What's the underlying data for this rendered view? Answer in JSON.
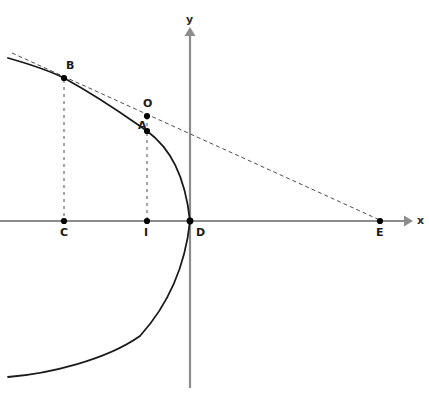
{
  "figure": {
    "caption": "",
    "background_color": "#ffffff",
    "axis_color": "#8c8c8c",
    "curve_color": "#1a1a1a",
    "dash_color": "#4d4d4d",
    "point_color": "#000000",
    "label_color": "#1a1a1a"
  },
  "axes": {
    "x": {
      "label": "x",
      "label_x": 417,
      "label_y": 215,
      "y_pixel": 221,
      "start_x": 0,
      "end_x": 412,
      "arrow": true
    },
    "y": {
      "label": "y",
      "label_x": 186,
      "label_y": 14,
      "x_pixel": 190,
      "start_y": 28,
      "end_y": 388,
      "arrow": true
    }
  },
  "points": [
    {
      "id": "B",
      "label": "B",
      "x": 64,
      "y": 78,
      "label_x": 66,
      "label_y": 60,
      "on_curve": true,
      "role": "tangency-point"
    },
    {
      "id": "O",
      "label": "O",
      "x": 147,
      "y": 116,
      "label_x": 143,
      "label_y": 98,
      "on_curve": false,
      "role": "tangent-line-point"
    },
    {
      "id": "A",
      "label": "A",
      "x": 147,
      "y": 131,
      "label_x": 138,
      "label_y": 120,
      "on_curve": true,
      "role": "curve-point"
    },
    {
      "id": "C",
      "label": "C",
      "x": 64,
      "y": 221,
      "label_x": 60,
      "label_y": 227,
      "on_curve": false,
      "role": "x-axis-foot"
    },
    {
      "id": "I",
      "label": "I",
      "x": 147,
      "y": 221,
      "label_x": 144,
      "label_y": 227,
      "on_curve": false,
      "role": "x-axis-foot"
    },
    {
      "id": "D",
      "label": "D",
      "x": 190,
      "y": 221,
      "label_x": 196,
      "label_y": 227,
      "on_curve": true,
      "role": "vertex-origin"
    },
    {
      "id": "E",
      "label": "E",
      "x": 380,
      "y": 221,
      "label_x": 376,
      "label_y": 227,
      "on_curve": false,
      "role": "tangent-x-intercept"
    }
  ],
  "curve": {
    "type": "parabola",
    "opens": "left",
    "vertex": {
      "x": 190,
      "y": 221
    },
    "description": "leftward-opening parabola through A(147,131), B(64,78), vertex D(190,221)",
    "path": "M 8,58 C 36,66 56,74 64,78 C 104,100 131,120 147,131 C 170,148 185,175 190,221 C 185,268 168,305 140,336 C 106,360 48,374 8,377",
    "stroke_width": 1.8
  },
  "tangent_line": {
    "description": "dashed tangent to the parabola at B, crossing the x-axis at E",
    "from": {
      "x": 12,
      "y": 53
    },
    "to": {
      "x": 382,
      "y": 221
    },
    "dash_pattern": "4 3",
    "stroke_width": 1
  },
  "droplines": [
    {
      "id": "B-C",
      "from_point": "B",
      "to_point": "C",
      "x": 64,
      "y1": 78,
      "y2": 221,
      "dash_pattern": "3 4"
    },
    {
      "id": "A-I",
      "from_point": "A",
      "to_point": "I",
      "x": 147,
      "y1": 131,
      "y2": 221,
      "dash_pattern": "3 4"
    }
  ]
}
